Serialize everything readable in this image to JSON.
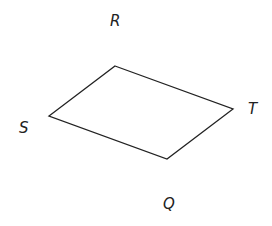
{
  "diagram": {
    "type": "quadrilateral",
    "stroke_color": "#222222",
    "fill_color": "none",
    "vertices": [
      {
        "x": 115,
        "y": 66
      },
      {
        "x": 233,
        "y": 109
      },
      {
        "x": 167,
        "y": 159
      },
      {
        "x": 49,
        "y": 116
      }
    ],
    "labels": [
      {
        "text": "R",
        "x": 110,
        "y": 26
      },
      {
        "text": "T",
        "x": 248,
        "y": 114
      },
      {
        "text": "S",
        "x": 19,
        "y": 133
      },
      {
        "text": "Q",
        "x": 163,
        "y": 209
      }
    ]
  }
}
